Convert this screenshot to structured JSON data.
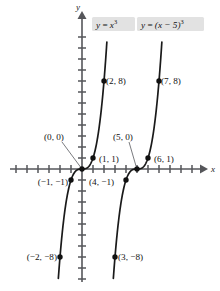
{
  "figure": {
    "axes": {
      "x_label": "x",
      "y_label": "y"
    },
    "equations": [
      {
        "id": "curve-1",
        "text_plain": "y = x³",
        "lhs": "y",
        "eq": " = ",
        "base": "x",
        "exponent": "3"
      },
      {
        "id": "curve-2",
        "text_plain": "y = (x − 5)³",
        "lhs": "y",
        "eq": " = ",
        "base": "(x − 5)",
        "exponent": "3"
      }
    ],
    "points": [
      {
        "label": "(2, 8)",
        "x": 2,
        "y": 8
      },
      {
        "label": "(7, 8)",
        "x": 7,
        "y": 8
      },
      {
        "label": "(1, 1)",
        "x": 1,
        "y": 1
      },
      {
        "label": "(6, 1)",
        "x": 6,
        "y": 1
      },
      {
        "label": "(0, 0)",
        "x": 0,
        "y": 0
      },
      {
        "label": "(5, 0)",
        "x": 5,
        "y": 0
      },
      {
        "label": "(−1, −1)",
        "x": -1,
        "y": -1
      },
      {
        "label": "(4, −1)",
        "x": 4,
        "y": -1
      },
      {
        "label": "(−2, −8)",
        "x": -2,
        "y": -8
      },
      {
        "label": "(3, −8)",
        "x": 3,
        "y": -8
      }
    ]
  },
  "chart_data": {
    "type": "line",
    "title": "",
    "xlabel": "x",
    "ylabel": "y",
    "xlim": [
      -7.5,
      11.5
    ],
    "ylim": [
      -13.5,
      13.5
    ],
    "grid": false,
    "legend": "inline-labels-top",
    "series": [
      {
        "name": "y = x³",
        "expression": "y = x^3",
        "labeled_points": [
          {
            "x": -2,
            "y": -8,
            "label": "(−2, −8)"
          },
          {
            "x": -1,
            "y": -1,
            "label": "(−1, −1)"
          },
          {
            "x": 0,
            "y": 0,
            "label": "(0, 0)"
          },
          {
            "x": 1,
            "y": 1,
            "label": "(1, 1)"
          },
          {
            "x": 2,
            "y": 8,
            "label": "(2, 8)"
          }
        ]
      },
      {
        "name": "y = (x − 5)³",
        "expression": "y = (x-5)^3",
        "labeled_points": [
          {
            "x": 3,
            "y": -8,
            "label": "(3, −8)"
          },
          {
            "x": 4,
            "y": -1,
            "label": "(4, −1)"
          },
          {
            "x": 5,
            "y": 0,
            "label": "(5, 0)"
          },
          {
            "x": 6,
            "y": 1,
            "label": "(6, 1)"
          },
          {
            "x": 7,
            "y": 8,
            "label": "(7, 8)"
          }
        ]
      }
    ]
  },
  "colors": {
    "axis": "#55565a",
    "curve": "#1a1a1a",
    "point": "#111111",
    "equation_box": "#e2e2e2",
    "background": "#ffffff"
  }
}
